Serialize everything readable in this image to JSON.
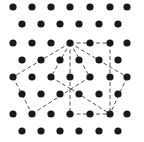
{
  "diagram": {
    "type": "triangular-lattice-dot-grid",
    "background": "#ffffff",
    "dot_color": "#1a1a1a",
    "line_color": "#555555",
    "dot_radius": 3.6,
    "rows": [
      {
        "y": 7,
        "xs": [
          13,
          32,
          51,
          70,
          90,
          110,
          127
        ]
      },
      {
        "y": 24,
        "xs": [
          22,
          41,
          60,
          79,
          99,
          118
        ]
      },
      {
        "y": 43,
        "xs": [
          13,
          32,
          51,
          70,
          90,
          110,
          127
        ]
      },
      {
        "y": 60,
        "xs": [
          22,
          41,
          60,
          79,
          99,
          118
        ]
      },
      {
        "y": 77,
        "xs": [
          13,
          32,
          51,
          70,
          90,
          110,
          127
        ]
      },
      {
        "y": 94,
        "xs": [
          22,
          41,
          60,
          79,
          99,
          118
        ]
      },
      {
        "y": 114,
        "xs": [
          13,
          32,
          51,
          70,
          90,
          110,
          127
        ]
      },
      {
        "y": 131,
        "xs": [
          22,
          41,
          60,
          79,
          99,
          118
        ]
      }
    ],
    "points": {
      "A": [
        70,
        43
      ],
      "P": [
        71,
        89
      ]
    },
    "dashed_segments": [
      [
        [
          70,
          43
        ],
        [
          110,
          43
        ]
      ],
      [
        [
          110,
          43
        ],
        [
          110,
          114
        ]
      ],
      [
        [
          70,
          43
        ],
        [
          13,
          77
        ]
      ],
      [
        [
          13,
          77
        ],
        [
          32,
          114
        ]
      ],
      [
        [
          32,
          114
        ],
        [
          71,
          89
        ]
      ],
      [
        [
          70,
          43
        ],
        [
          51,
          77
        ]
      ],
      [
        [
          51,
          77
        ],
        [
          71,
          89
        ]
      ],
      [
        [
          70,
          43
        ],
        [
          70,
          114
        ]
      ],
      [
        [
          70,
          114
        ],
        [
          110,
          114
        ]
      ],
      [
        [
          70,
          43
        ],
        [
          90,
          77
        ]
      ],
      [
        [
          90,
          77
        ],
        [
          71,
          89
        ]
      ],
      [
        [
          71,
          89
        ],
        [
          110,
          114
        ]
      ],
      [
        [
          70,
          43
        ],
        [
          127,
          77
        ]
      ],
      [
        [
          127,
          77
        ],
        [
          110,
          114
        ]
      ]
    ]
  }
}
